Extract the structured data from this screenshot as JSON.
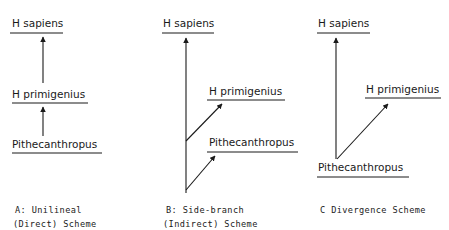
{
  "diagram": {
    "type": "phylogeny-schemes",
    "panels": [
      {
        "id": "A",
        "caption_line1": "A: Unilineal",
        "caption_line2": "(Direct) Scheme",
        "nodes": {
          "top": "H sapiens",
          "middle": "H primigenius",
          "bottom": "Pithecanthropus"
        },
        "edges": [
          {
            "from": "Pithecanthropus",
            "to": "H primigenius"
          },
          {
            "from": "H primigenius",
            "to": "H sapiens"
          }
        ]
      },
      {
        "id": "B",
        "caption_line1": "B: Side-branch",
        "caption_line2": "(Indirect) Scheme",
        "nodes": {
          "top": "H sapiens",
          "middle": "H primigenius",
          "bottom": "Pithecanthropus"
        },
        "edges": [
          {
            "from": "common stem",
            "to": "H sapiens"
          },
          {
            "from": "common stem",
            "to": "H primigenius"
          },
          {
            "from": "common stem",
            "to": "Pithecanthropus"
          }
        ]
      },
      {
        "id": "C",
        "caption_line1": "C Divergence Scheme",
        "caption_line2": "",
        "nodes": {
          "top": "H sapiens",
          "middle": "H primigenius",
          "bottom": "Pithecanthropus"
        },
        "edges": [
          {
            "from": "Pithecanthropus",
            "to": "H sapiens"
          },
          {
            "from": "Pithecanthropus",
            "to": "H primigenius"
          }
        ]
      }
    ],
    "colors": {
      "ink": "#1a1a1a",
      "background": "#ffffff"
    }
  }
}
